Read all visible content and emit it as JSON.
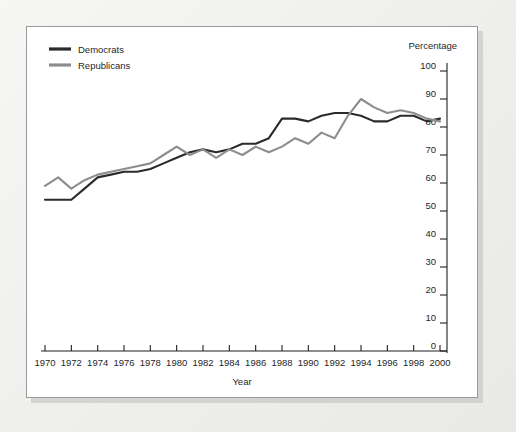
{
  "chart_data": {
    "type": "line",
    "title": "",
    "xlabel": "Year",
    "ylabel": "Percentage",
    "unit_label": "Percentage",
    "xlim": [
      1970,
      2000
    ],
    "ylim": [
      0,
      100
    ],
    "grid": false,
    "legend_position": "top-left",
    "x_tick_labels": [
      "1970",
      "1972",
      "1974",
      "1976",
      "1978",
      "1980",
      "1982",
      "1984",
      "1986",
      "1988",
      "1990",
      "1992",
      "1994",
      "1996",
      "1998",
      "2000"
    ],
    "x_ticks": [
      1970,
      1972,
      1974,
      1976,
      1978,
      1980,
      1982,
      1984,
      1986,
      1988,
      1990,
      1992,
      1994,
      1996,
      1998,
      2000
    ],
    "y_tick_labels": [
      "0",
      "10",
      "20",
      "30",
      "40",
      "50",
      "60",
      "70",
      "80",
      "90",
      "100"
    ],
    "y_ticks": [
      0,
      10,
      20,
      30,
      40,
      50,
      60,
      70,
      80,
      90,
      100
    ],
    "x": [
      1970,
      1971,
      1972,
      1973,
      1974,
      1975,
      1976,
      1977,
      1978,
      1979,
      1980,
      1981,
      1982,
      1983,
      1984,
      1985,
      1986,
      1987,
      1988,
      1989,
      1990,
      1991,
      1992,
      1993,
      1994,
      1995,
      1996,
      1997,
      1998,
      1999,
      2000
    ],
    "series": [
      {
        "name": "Democrats",
        "color": "#2b2b2b",
        "values": [
          54,
          54,
          54,
          58,
          62,
          63,
          64,
          64,
          65,
          67,
          69,
          71,
          72,
          71,
          72,
          74,
          74,
          76,
          83,
          83,
          82,
          84,
          85,
          85,
          84,
          82,
          82,
          84,
          84,
          82,
          83
        ]
      },
      {
        "name": "Republicans",
        "color": "#8d8d8d",
        "values": [
          59,
          62,
          58,
          61,
          63,
          64,
          65,
          66,
          67,
          70,
          73,
          70,
          72,
          69,
          72,
          70,
          73,
          71,
          73,
          76,
          74,
          78,
          76,
          84,
          90,
          87,
          85,
          86,
          85,
          83,
          82
        ]
      }
    ]
  },
  "legend": {
    "items": [
      {
        "label": "Democrats"
      },
      {
        "label": "Republicans"
      }
    ]
  },
  "axes": {
    "x_axis_title": "Year",
    "y_axis_unit": "Percentage"
  }
}
